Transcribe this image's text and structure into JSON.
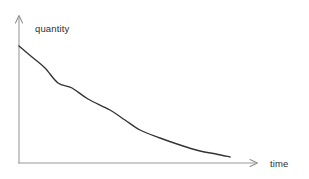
{
  "figure": {
    "title": "",
    "background_color": "#ffffff",
    "width": 309,
    "height": 179
  },
  "labels": {
    "y_axis": "quantity",
    "x_axis": "time"
  },
  "colors": {
    "axis": "#9a9a9a",
    "curve": "#333333",
    "text": "#2e2e2e",
    "background": "#ffffff"
  },
  "icons": {
    "y_axis_arrow": "arrow-up-icon",
    "x_axis_arrow": "arrow-right-icon"
  },
  "chart_data": {
    "type": "line",
    "title": "",
    "xlabel": "time",
    "ylabel": "quantity",
    "grid": false,
    "legend": null,
    "axis_arrows": true,
    "tick_labels": {
      "x": [],
      "y": []
    },
    "xlim": [
      0,
      1
    ],
    "ylim": [
      0,
      1
    ],
    "series": [
      {
        "name": "decay",
        "color": "#333333",
        "x": [
          0.0,
          0.06,
          0.12,
          0.17,
          0.23,
          0.3,
          0.38,
          0.46,
          0.55,
          0.64,
          0.74,
          0.84,
          0.92,
          1.0
        ],
        "y": [
          1.0,
          0.86,
          0.74,
          0.66,
          0.58,
          0.5,
          0.42,
          0.35,
          0.28,
          0.22,
          0.16,
          0.11,
          0.08,
          0.05
        ],
        "pixel_points": [
          [
            19,
            46
          ],
          [
            32,
            57
          ],
          [
            45,
            68
          ],
          [
            58,
            83
          ],
          [
            72,
            88
          ],
          [
            88,
            99
          ],
          [
            110,
            110
          ],
          [
            125,
            120
          ],
          [
            140,
            130
          ],
          [
            160,
            138
          ],
          [
            180,
            145
          ],
          [
            200,
            151
          ],
          [
            216,
            154
          ],
          [
            230,
            157
          ]
        ]
      }
    ]
  },
  "axes_geometry": {
    "origin": [
      19,
      163
    ],
    "y_axis_top": [
      19,
      16
    ],
    "x_axis_right": [
      258,
      163
    ]
  }
}
